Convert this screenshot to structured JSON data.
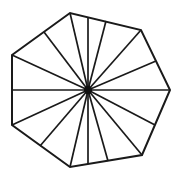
{
  "figure": {
    "name": "radial-sectored-polygon",
    "title": "Irregular polygon subdivided into triangular sectors by radial spokes",
    "canvas": {
      "width": 180,
      "height": 180,
      "background": "#ffffff"
    },
    "style": {
      "stroke_color": "#1a1a1a",
      "fill_color": "#ffffff",
      "outline_stroke_width": 2.0,
      "spoke_stroke_width": 1.7,
      "hub_color": "#111111",
      "hub_radius": 4.2
    },
    "center": {
      "x": 88,
      "y": 90
    },
    "outline_vertices": [
      {
        "x": 12,
        "y": 55
      },
      {
        "x": 70,
        "y": 13
      },
      {
        "x": 141,
        "y": 30
      },
      {
        "x": 170,
        "y": 90
      },
      {
        "x": 142,
        "y": 155
      },
      {
        "x": 70,
        "y": 167
      },
      {
        "x": 12,
        "y": 125
      }
    ],
    "spoke_endpoints": [
      {
        "x": 12,
        "y": 90
      },
      {
        "x": 12,
        "y": 55
      },
      {
        "x": 44,
        "y": 32
      },
      {
        "x": 70,
        "y": 13
      },
      {
        "x": 88,
        "y": 17
      },
      {
        "x": 106,
        "y": 21
      },
      {
        "x": 141,
        "y": 30
      },
      {
        "x": 156,
        "y": 61
      },
      {
        "x": 170,
        "y": 90
      },
      {
        "x": 155,
        "y": 125
      },
      {
        "x": 142,
        "y": 155
      },
      {
        "x": 108,
        "y": 161
      },
      {
        "x": 88,
        "y": 164
      },
      {
        "x": 70,
        "y": 167
      },
      {
        "x": 40,
        "y": 146
      },
      {
        "x": 12,
        "y": 125
      }
    ],
    "counts": {
      "outline_sides": 7,
      "spokes": 16,
      "sectors": 16
    }
  }
}
